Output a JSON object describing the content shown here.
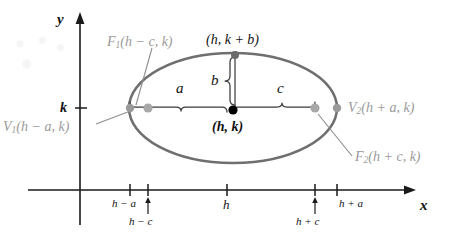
{
  "figure": {
    "kind": "ellipse-diagram"
  },
  "axes": {
    "x_label": "x",
    "y_label": "y"
  },
  "y_axis_ticks": [
    {
      "label": "k"
    }
  ],
  "x_axis_ticks": [
    {
      "label": "h − a"
    },
    {
      "label": "h − c"
    },
    {
      "label": "h"
    },
    {
      "label": "h + c"
    },
    {
      "label": "h + a"
    }
  ],
  "points": [
    {
      "name": "vertex-left",
      "label": "V",
      "sub": "1",
      "coords": "(h − a, k)",
      "color": "#9a9a9a"
    },
    {
      "name": "vertex-right",
      "label": "V",
      "sub": "2",
      "coords": "(h + a, k)",
      "color": "#9a9a9a"
    },
    {
      "name": "focus-left",
      "label": "F",
      "sub": "1",
      "coords": "(h − c, k)",
      "color": "#9a9a9a"
    },
    {
      "name": "focus-right",
      "label": "F",
      "sub": "2",
      "coords": "(h + c, k)",
      "color": "#9a9a9a"
    },
    {
      "name": "co-vertex-top",
      "label": "",
      "sub": "",
      "coords": "(h, k + b)",
      "color": "#3a3a3a"
    },
    {
      "name": "center",
      "label": "",
      "sub": "",
      "coords": "(h, k)",
      "color": "#000000"
    }
  ],
  "measures": [
    {
      "name": "semi-major-axis",
      "label": "a"
    },
    {
      "name": "semi-minor-axis",
      "label": "b"
    },
    {
      "name": "focal-distance",
      "label": "c"
    }
  ],
  "colors": {
    "ellipse": "#6f6f6f",
    "axis": "#1a1a1a",
    "gray_label": "#9a9a9a",
    "leader": "#8d8d8d",
    "brace": "#3a3a3a",
    "center_dot": "#000000"
  }
}
